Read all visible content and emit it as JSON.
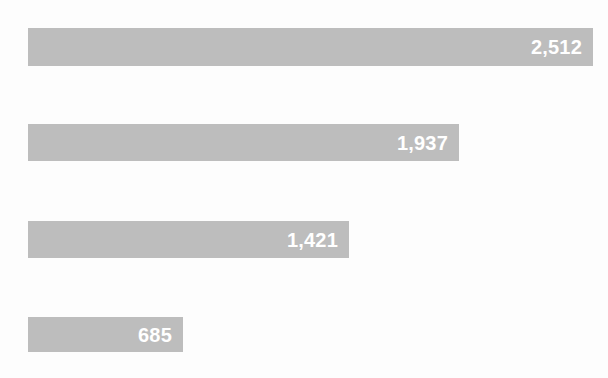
{
  "chart_data": {
    "type": "bar",
    "orientation": "horizontal",
    "title": "",
    "subtitle": "",
    "xlabel": "",
    "ylabel": "",
    "categories": [
      "",
      "",
      "",
      ""
    ],
    "values": [
      2512,
      1937,
      1421,
      685
    ],
    "value_labels": [
      "2,512",
      "1,937",
      "1,421",
      "685"
    ],
    "xlim": [
      0,
      2512
    ],
    "grid": false,
    "legend": null,
    "axis_visible": false,
    "tick_labels": [],
    "annotations": [],
    "series": [
      {
        "name": "",
        "values": [
          2512,
          1937,
          1421,
          685
        ]
      }
    ]
  },
  "style": {
    "bar_color": "#bdbdbd",
    "label_color": "#ffffff",
    "background_color": "#fdfdfd"
  },
  "bars": [
    {
      "value_label": "2,512",
      "value": 2512,
      "top": 28,
      "height": 38,
      "width_px": 565
    },
    {
      "value_label": "1,937",
      "value": 1937,
      "top": 124,
      "height": 37,
      "width_px": 431
    },
    {
      "value_label": "1,421",
      "value": 1421,
      "top": 221,
      "height": 37,
      "width_px": 321
    },
    {
      "value_label": "685",
      "value": 685,
      "top": 317,
      "height": 35,
      "width_px": 155
    }
  ]
}
